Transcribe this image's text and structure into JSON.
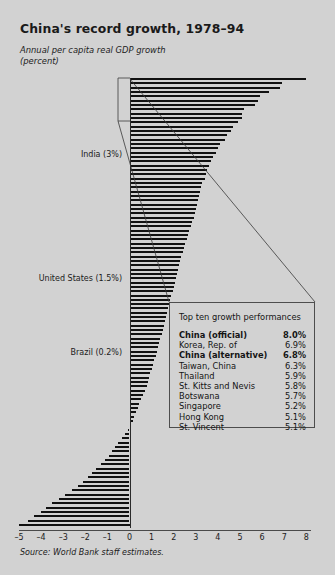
{
  "header": {
    "title": "China's record growth, 1978–94",
    "subtitle": "Annual per capita real GDP growth\n(percent)"
  },
  "annotations": [
    {
      "label": "India (3%)",
      "value": 3.0,
      "x": 122,
      "y": 150
    },
    {
      "label": "United States (1.5%)",
      "value": 1.5,
      "x": 122,
      "y": 274
    },
    {
      "label": "Brazil (0.2%)",
      "value": 0.2,
      "x": 122,
      "y": 348
    }
  ],
  "callout": {
    "heading": "Top ten growth performances",
    "rows": [
      {
        "name": "China (official)",
        "value": "8.0%",
        "bold": true
      },
      {
        "name": "Korea, Rep. of",
        "value": "6.9%",
        "bold": false
      },
      {
        "name": "China (alternative)",
        "value": "6.8%",
        "bold": true
      },
      {
        "name": "Taiwan, China",
        "value": "6.3%",
        "bold": false
      },
      {
        "name": "Thailand",
        "value": "5.9%",
        "bold": false
      },
      {
        "name": "St. Kitts and Nevis",
        "value": "5.8%",
        "bold": false
      },
      {
        "name": "Botswana",
        "value": "5.7%",
        "bold": false
      },
      {
        "name": "Singapore",
        "value": "5.2%",
        "bold": false
      },
      {
        "name": "Hong Kong",
        "value": "5.1%",
        "bold": false
      },
      {
        "name": "St. Vincent",
        "value": "5.1%",
        "bold": false
      }
    ]
  },
  "source": "Source: World Bank staff estimates.",
  "colors": {
    "background": "#d2d2d2",
    "bar": "#111111",
    "axis": "#4a4a4a",
    "text": "#1b1b1b",
    "callout_border": "#4d4d4d"
  },
  "chart_data": {
    "type": "bar",
    "orientation": "horizontal",
    "title": "China's record growth, 1978–94",
    "xlabel": "Annual per capita real GDP growth (percent)",
    "ylabel": "",
    "xlim": [
      -5,
      8
    ],
    "xticks": [
      -5,
      -4,
      -3,
      -2,
      -1,
      0,
      1,
      2,
      3,
      4,
      5,
      6,
      7,
      8
    ],
    "xticklabels": [
      "–5",
      "–4",
      "–3",
      "–2",
      "–1",
      "0",
      "1",
      "2",
      "3",
      "4",
      "5",
      "6",
      "7",
      "8"
    ],
    "grid": false,
    "legend": false,
    "sorted": "descending",
    "note": "Each bar is one economy's average annual per capita real GDP growth 1978-94; countries unlabeled except three annotated reference economies.",
    "values": [
      8.0,
      6.9,
      6.8,
      6.3,
      5.9,
      5.8,
      5.7,
      5.2,
      5.1,
      5.1,
      4.9,
      4.7,
      4.6,
      4.4,
      4.3,
      4.1,
      4.0,
      3.9,
      3.8,
      3.7,
      3.6,
      3.5,
      3.45,
      3.4,
      3.3,
      3.25,
      3.2,
      3.15,
      3.1,
      3.05,
      3.0,
      2.95,
      2.9,
      2.85,
      2.8,
      2.7,
      2.65,
      2.6,
      2.5,
      2.45,
      2.4,
      2.35,
      2.3,
      2.25,
      2.2,
      2.15,
      2.1,
      2.05,
      2.0,
      1.95,
      1.9,
      1.85,
      1.8,
      1.75,
      1.7,
      1.65,
      1.6,
      1.55,
      1.5,
      1.45,
      1.4,
      1.35,
      1.3,
      1.25,
      1.2,
      1.1,
      1.05,
      1.0,
      0.95,
      0.9,
      0.85,
      0.8,
      0.7,
      0.6,
      0.5,
      0.45,
      0.4,
      0.3,
      0.2,
      0.15,
      0.05,
      -0.05,
      -0.2,
      -0.35,
      -0.5,
      -0.65,
      -0.8,
      -0.95,
      -1.1,
      -1.3,
      -1.5,
      -1.7,
      -1.9,
      -2.1,
      -2.35,
      -2.6,
      -2.9,
      -3.2,
      -3.5,
      -3.8,
      -4.0,
      -4.3,
      -4.6,
      -5.0
    ]
  },
  "geometry": {
    "zero_x": 129.5,
    "px_per_unit": 22.1,
    "plot_top": 78,
    "bar_pitch": 4.33,
    "bar_height": 2,
    "axis_y": 530
  }
}
